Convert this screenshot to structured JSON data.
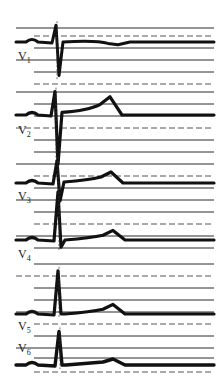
{
  "colors": {
    "background": "#ffffff",
    "trace": "#111111",
    "grid": "#2a2a2a"
  },
  "leads": [
    {
      "name": "V",
      "sub": "1",
      "qrs": "rS",
      "r_amp": 0.6,
      "s_amp": -1.2,
      "t_amp": -0.1,
      "st": 0.0
    },
    {
      "name": "V",
      "sub": "2",
      "qrs": "RS",
      "r_amp": 0.9,
      "s_amp": -1.9,
      "t_amp": 0.6,
      "st": 0.1
    },
    {
      "name": "V",
      "sub": "3",
      "qrs": "RS",
      "r_amp": 1.1,
      "s_amp": -0.9,
      "t_amp": 0.5,
      "st": 0.05
    },
    {
      "name": "V",
      "sub": "4",
      "qrs": "R",
      "r_amp": 2.0,
      "s_amp": -0.3,
      "t_amp": 0.4,
      "st": 0.0
    },
    {
      "name": "V",
      "sub": "5",
      "qrs": "R",
      "r_amp": 1.8,
      "s_amp": 0.0,
      "t_amp": 0.4,
      "st": 0.0
    },
    {
      "name": "V",
      "sub": "6",
      "qrs": "R",
      "r_amp": 1.4,
      "s_amp": 0.0,
      "t_amp": 0.25,
      "st": 0.0
    }
  ]
}
